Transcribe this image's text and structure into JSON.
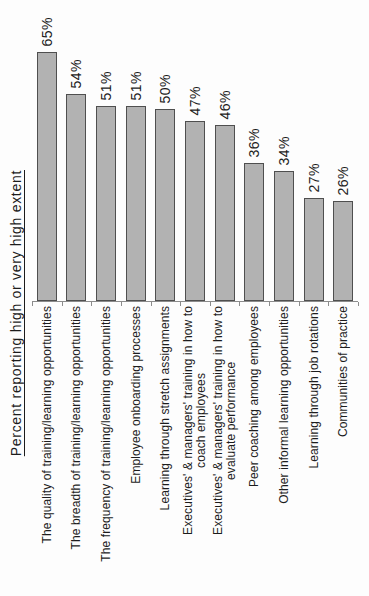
{
  "chart_data": {
    "type": "bar",
    "title": "",
    "ylabel": "Percent reporting high or very high extent",
    "xlabel": "",
    "categories": [
      "The quality of training/learning opportunities",
      "The breadth of training/learning opportunities",
      "The frequency of training/learning opportunities",
      "Employee onboarding processes",
      "Learning through stretch assignments",
      "Executives' & managers' training in how to\ncoach employees",
      "Executives' & managers' training in how to\nevaluate performance",
      "Peer coaching among employees",
      "Other informal learning opportunities",
      "Learning through job rotations",
      "Communities of practice"
    ],
    "values": [
      65,
      54,
      51,
      51,
      50,
      47,
      46,
      36,
      34,
      27,
      26
    ],
    "value_labels": [
      "65%",
      "54%",
      "51%",
      "51%",
      "50%",
      "47%",
      "46%",
      "36%",
      "34%",
      "27%",
      "26%"
    ],
    "ylim": [
      0,
      70
    ],
    "grid": false,
    "legend": false,
    "bar_fill_color": "#b2b2b2",
    "bar_border_color": "#4f4f4f",
    "axis_color": "#8c8c8c",
    "text_color": "#1c1c1c"
  }
}
